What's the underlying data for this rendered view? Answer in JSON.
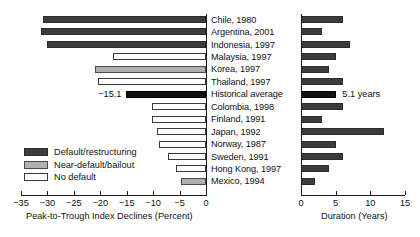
{
  "chart_data": {
    "type": "bar",
    "title": "",
    "orientation": "horizontal",
    "panels": [
      {
        "name": "declines",
        "xlabel": "Peak-to-Trough Index Declines (Percent)",
        "xlim": [
          -35,
          0
        ],
        "ticks": [
          -35,
          -30,
          -25,
          -20,
          -15,
          -10,
          -5,
          0
        ],
        "tick_labels": [
          "−35",
          "−30",
          "−25",
          "−20",
          "−15",
          "−10",
          "−5",
          "0"
        ],
        "grid": false
      },
      {
        "name": "duration",
        "xlabel": "Duration (Years)",
        "xlim": [
          0,
          15
        ],
        "ticks": [
          0,
          5,
          10,
          15
        ],
        "tick_labels": [
          "0",
          "5",
          "10",
          "15"
        ],
        "grid": false
      }
    ],
    "categories": [
      "Chile, 1980",
      "Argentina, 2001",
      "Indonesia, 1997",
      "Malaysia, 1997",
      "Korea, 1997",
      "Thailand, 1997",
      "Historical average",
      "Colombia, 1998",
      "Finland, 1991",
      "Japan, 1992",
      "Norway, 1987",
      "Sweden, 1991",
      "Hong Kong, 1997",
      "Mexico, 1994"
    ],
    "series": [
      {
        "name": "Peak-to-Trough Index Declines (Percent)",
        "values": [
          -30.8,
          -31.2,
          -30.0,
          -17.6,
          -21.0,
          -20.4,
          -15.1,
          -10.2,
          -10.2,
          -9.3,
          -8.9,
          -7.2,
          -5.7,
          -4.7
        ]
      },
      {
        "name": "Duration (Years)",
        "values": [
          6.0,
          3.0,
          7.0,
          5.0,
          4.0,
          6.0,
          5.1,
          6.0,
          3.0,
          12.0,
          5.0,
          6.0,
          4.0,
          2.0
        ]
      }
    ],
    "category_types": [
      "default",
      "default",
      "default",
      "none",
      "near",
      "none",
      "average",
      "none",
      "none",
      "none",
      "none",
      "none",
      "none",
      "near"
    ],
    "annotations": [
      {
        "text": "−15.1",
        "panel": "declines",
        "category": "Historical average"
      },
      {
        "text": "5.1 years",
        "panel": "duration",
        "category": "Historical average"
      }
    ],
    "legend": {
      "position": "lower-left",
      "entries": [
        {
          "label": "Default/restructuring",
          "type": "default",
          "color": "#3c3c3c"
        },
        {
          "label": "Near-default/bailout",
          "type": "near",
          "color": "#b0b0b0"
        },
        {
          "label": "No default",
          "type": "none",
          "color": "#ffffff"
        }
      ]
    }
  }
}
